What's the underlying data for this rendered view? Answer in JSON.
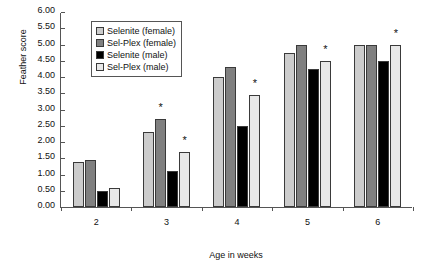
{
  "chart_data": {
    "type": "bar",
    "title": "",
    "xlabel": "Age in weeks",
    "ylabel": "Feather score",
    "categories": [
      "2",
      "3",
      "4",
      "5",
      "6"
    ],
    "ylim": [
      0,
      6
    ],
    "ytick_step": 0.5,
    "ytick_labels": [
      "0.00",
      "0.50",
      "1.00",
      "1.50",
      "2.00",
      "2.50",
      "3.00",
      "3.50",
      "4.00",
      "4.50",
      "5.00",
      "5.50",
      "6.00"
    ],
    "grid": false,
    "legend_position": "upper-left-inside",
    "series": [
      {
        "name": "Selenite (female)",
        "color": "#cccccc",
        "values": [
          1.4,
          2.3,
          4.0,
          4.75,
          5.0
        ]
      },
      {
        "name": "Sel-Plex (female)",
        "color": "#808080",
        "values": [
          1.45,
          2.7,
          4.3,
          5.0,
          5.0
        ]
      },
      {
        "name": "Selenite (male)",
        "color": "#000000",
        "values": [
          0.5,
          1.1,
          2.5,
          4.25,
          4.5
        ]
      },
      {
        "name": "Sel-Plex (male)",
        "color": "#e8e8e8",
        "values": [
          0.6,
          1.7,
          3.45,
          4.5,
          5.0
        ]
      }
    ],
    "annotations": [
      {
        "symbol": "*",
        "category": "3",
        "series": "Sel-Plex (female)",
        "value": 2.7
      },
      {
        "symbol": "*",
        "category": "3",
        "series": "Sel-Plex (male)",
        "value": 1.7
      },
      {
        "symbol": "*",
        "category": "4",
        "series": "Sel-Plex (male)",
        "value": 3.45
      },
      {
        "symbol": "*",
        "category": "5",
        "series": "Sel-Plex (male)",
        "value": 4.5
      },
      {
        "symbol": "*",
        "category": "6",
        "series": "Sel-Plex (male)",
        "value": 5.0
      }
    ]
  }
}
